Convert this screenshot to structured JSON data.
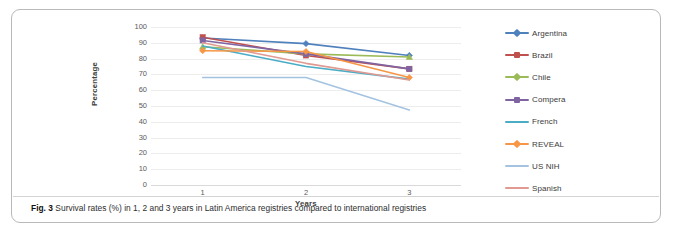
{
  "figure": {
    "caption_label": "Fig. 3",
    "caption_text": "Survival rates (%) in 1, 2 and 3 years in Latin America registries compared to international registries"
  },
  "chart_data": {
    "type": "line",
    "title": "",
    "xlabel": "Years",
    "ylabel": "Percentage",
    "x": [
      1,
      2,
      3
    ],
    "categories": [
      "1",
      "2",
      "3"
    ],
    "xtick_labels": [
      "1",
      "2",
      "3"
    ],
    "ytick_labels": [
      "100",
      "90",
      "80",
      "70",
      "60",
      "50",
      "40",
      "30",
      "20",
      "10",
      "0"
    ],
    "yticks": [
      100,
      90,
      80,
      70,
      60,
      50,
      40,
      30,
      20,
      10,
      0
    ],
    "ylim": [
      0,
      100
    ],
    "xlim": [
      0.5,
      3.5
    ],
    "grid": "horizontal",
    "legend_position": "right",
    "series": [
      {
        "name": "Argentina",
        "color": "#4f81bd",
        "marker": "diamond",
        "values": [
          93,
          89.5,
          82
        ]
      },
      {
        "name": "Brazil",
        "color": "#c0504d",
        "marker": "square",
        "values": [
          93.5,
          82,
          73.5
        ]
      },
      {
        "name": "Chile",
        "color": "#9bbb59",
        "marker": "triangle",
        "values": [
          87.5,
          83,
          81
        ]
      },
      {
        "name": "Compera",
        "color": "#8064a2",
        "marker": "square",
        "values": [
          91.5,
          83,
          73.5
        ]
      },
      {
        "name": "French",
        "color": "#4bacc6",
        "marker": "line",
        "values": [
          88,
          75,
          67
        ]
      },
      {
        "name": "REVEAL",
        "color": "#f79646",
        "marker": "diamond",
        "values": [
          85,
          84.5,
          68
        ]
      },
      {
        "name": "US NIH",
        "color": "#a5c3e0",
        "marker": "line",
        "values": [
          68,
          68,
          47.5
        ]
      },
      {
        "name": "Spanish",
        "color": "#e09a92",
        "marker": "line",
        "values": [
          90,
          77,
          66.5
        ]
      }
    ]
  },
  "legend": {
    "items": [
      {
        "label": "Argentina"
      },
      {
        "label": "Brazil"
      },
      {
        "label": "Chile"
      },
      {
        "label": "Compera"
      },
      {
        "label": "French"
      },
      {
        "label": "REVEAL"
      },
      {
        "label": "US NIH"
      },
      {
        "label": "Spanish"
      }
    ]
  }
}
